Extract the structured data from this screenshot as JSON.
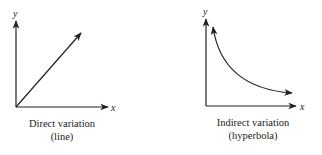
{
  "diagrams": [
    {
      "name": "direct-variation",
      "axis_x_label": "x",
      "axis_y_label": "y",
      "caption_line1": "Direct variation",
      "caption_line2": "(line)"
    },
    {
      "name": "indirect-variation",
      "axis_x_label": "x",
      "axis_y_label": "y",
      "caption_line1": "Indirect variation",
      "caption_line2": "(hyperbola)"
    }
  ],
  "colors": {
    "stroke": "#222222",
    "background": "#ffffff"
  }
}
